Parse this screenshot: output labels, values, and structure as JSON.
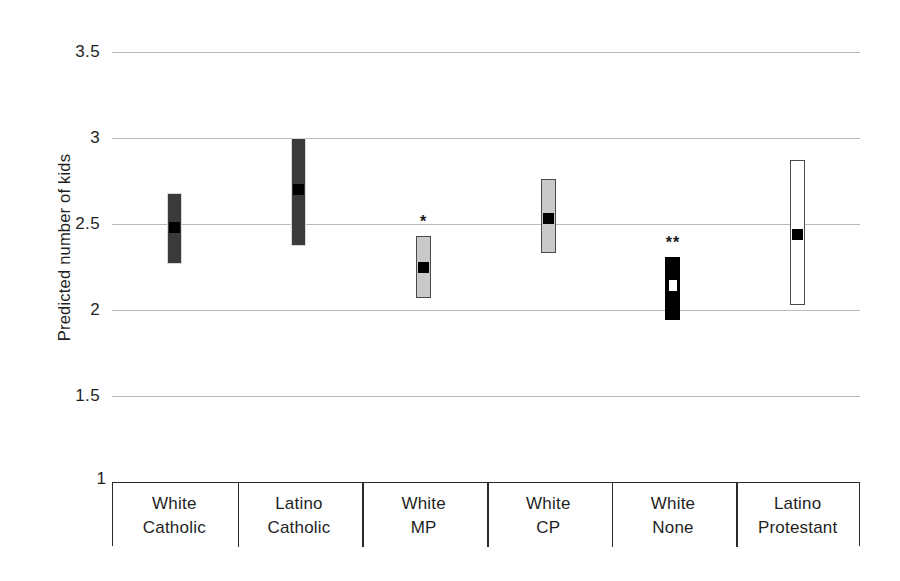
{
  "chart_data": {
    "type": "bar",
    "title": "",
    "subtitle": "",
    "xlabel": "",
    "ylabel": "Predicted number of kids",
    "ylim": [
      1,
      3.5
    ],
    "yticks": [
      3.5,
      3,
      2.5,
      2,
      1.5,
      1
    ],
    "ytick_labels": [
      "3.5",
      "3",
      "2.5",
      "2",
      "1.5",
      "1"
    ],
    "grid": "horizontal",
    "legend": "none",
    "categories": [
      "White Catholic",
      "Latino Catholic",
      "White MP",
      "White CP",
      "White None",
      "Latino Protestant"
    ],
    "series": [
      {
        "name": "Predicted number of kids (point estimate with confidence interval)",
        "values": [
          2.48,
          2.7,
          2.25,
          2.53,
          2.14,
          2.44
        ],
        "ci_low": [
          2.27,
          2.37,
          2.07,
          2.33,
          1.94,
          2.03
        ],
        "ci_high": [
          2.68,
          3.0,
          2.43,
          2.76,
          2.31,
          2.87
        ]
      }
    ],
    "annotations": [
      {
        "category": "White MP",
        "text": "*",
        "y": 2.5
      },
      {
        "category": "White None",
        "text": "**",
        "y": 2.39
      }
    ],
    "bars": [
      {
        "label_line1": "White",
        "label_line2": "Catholic",
        "estimate": 2.48,
        "low": 2.27,
        "high": 2.68,
        "fill_style": "darkgray",
        "marker_color": "black",
        "significance": ""
      },
      {
        "label_line1": "Latino",
        "label_line2": "Catholic",
        "estimate": 2.7,
        "low": 2.37,
        "high": 3.0,
        "fill_style": "darkgray",
        "marker_color": "black",
        "significance": ""
      },
      {
        "label_line1": "White",
        "label_line2": "MP",
        "estimate": 2.25,
        "low": 2.07,
        "high": 2.43,
        "fill_style": "lightgray",
        "marker_color": "black",
        "significance": "*"
      },
      {
        "label_line1": "White",
        "label_line2": "CP",
        "estimate": 2.53,
        "low": 2.33,
        "high": 2.76,
        "fill_style": "lightgray",
        "marker_color": "black",
        "significance": ""
      },
      {
        "label_line1": "White",
        "label_line2": "None",
        "estimate": 2.14,
        "low": 1.94,
        "high": 2.31,
        "fill_style": "black",
        "marker_color": "white",
        "significance": "**"
      },
      {
        "label_line1": "Latino",
        "label_line2": "Protestant",
        "estimate": 2.44,
        "low": 2.03,
        "high": 2.87,
        "fill_style": "white",
        "marker_color": "black",
        "significance": ""
      }
    ]
  },
  "colors": {
    "gridline": "#b9b9b9",
    "axis": "#2a2a2a",
    "dark_fill": "#3a3a3a",
    "light_fill": "#c9c9c9",
    "black_fill": "#000000",
    "white_fill": "#ffffff",
    "text": "#1f1f1f"
  },
  "axis_origin_label": "1"
}
